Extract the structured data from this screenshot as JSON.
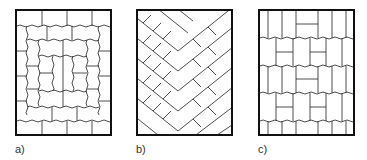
{
  "figure": {
    "panels": [
      {
        "id": "a",
        "label": "a)",
        "pattern": "concentric-frame paving (stretcher rings around center)"
      },
      {
        "id": "b",
        "label": "b)",
        "pattern": "diagonal herringbone paving"
      },
      {
        "id": "c",
        "label": "c)",
        "pattern": "basket-weave paving (parquet)"
      }
    ],
    "colors": {
      "stroke": "#111111",
      "background": "#ffffff",
      "label": "#333333"
    }
  }
}
